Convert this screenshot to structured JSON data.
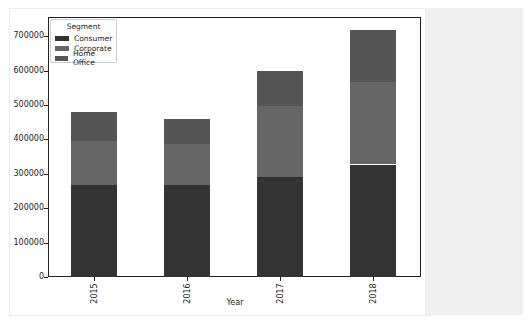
{
  "chart_data": {
    "type": "bar",
    "stacked": true,
    "title": "",
    "xlabel": "Year",
    "ylabel": "",
    "categories": [
      "2015",
      "2016",
      "2017",
      "2018"
    ],
    "series": [
      {
        "name": "Consumer",
        "color": "#333333",
        "values": [
          266000,
          266000,
          291000,
          327000
        ]
      },
      {
        "name": "Corporate",
        "color": "#666666",
        "values": [
          128000,
          122000,
          205000,
          239000
        ]
      },
      {
        "name": "Home Office",
        "color": "#555555",
        "values": [
          85000,
          70000,
          102000,
          152000
        ]
      }
    ],
    "totals": [
      479000,
      458000,
      598000,
      718000
    ],
    "ylim": [
      0,
      750000
    ],
    "yticks": [
      "0",
      "100000",
      "200000",
      "300000",
      "400000",
      "500000",
      "600000",
      "700000"
    ],
    "grid": false,
    "legend": {
      "title": "Segment",
      "position": "upper left",
      "entries": [
        "Consumer",
        "Corporate",
        "Home Office"
      ]
    }
  }
}
